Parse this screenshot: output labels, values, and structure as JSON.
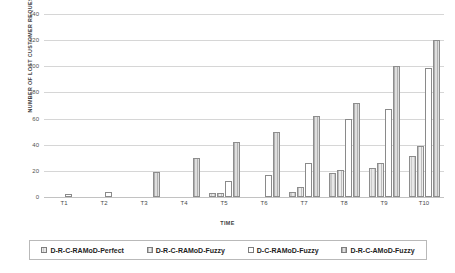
{
  "chart_data": {
    "type": "bar",
    "title": "",
    "xlabel": "TIME",
    "ylabel": "NUMBER OF LOST CUSTOMER REQUESTS",
    "categories": [
      "T1",
      "T2",
      "T3",
      "T4",
      "T5",
      "T6",
      "T7",
      "T8",
      "T9",
      "T10"
    ],
    "ylim": [
      0,
      140
    ],
    "yticks": [
      0,
      20,
      40,
      60,
      80,
      100,
      120,
      140
    ],
    "ytick_labels": [
      "0",
      "20",
      "40",
      "60",
      "80",
      "100",
      "120",
      "140"
    ],
    "grid": true,
    "legend_position": "bottom",
    "series": [
      {
        "name": "D-R-C-RAMoD-Perfect",
        "values": [
          0,
          0,
          0,
          0,
          3,
          0,
          4,
          18,
          22,
          31
        ]
      },
      {
        "name": "D-R-C-RAMoD-Fuzzy",
        "values": [
          0,
          0,
          0,
          0,
          3,
          0,
          8,
          21,
          26,
          39
        ]
      },
      {
        "name": "D-C-RAMoD-Fuzzy",
        "values": [
          2,
          4,
          0,
          0,
          12,
          17,
          26,
          60,
          67,
          99
        ]
      },
      {
        "name": "D-R-C-AMoD-Fuzzy",
        "values": [
          0,
          0,
          19,
          30,
          42,
          50,
          62,
          72,
          100,
          120
        ]
      }
    ]
  },
  "legend": {
    "items": [
      {
        "label": "D-R-C-RAMoD-Perfect"
      },
      {
        "label": "D-R-C-RAMoD-Fuzzy"
      },
      {
        "label": "D-C-RAMoD-Fuzzy"
      },
      {
        "label": "D-R-C-AMoD-Fuzzy"
      }
    ]
  }
}
